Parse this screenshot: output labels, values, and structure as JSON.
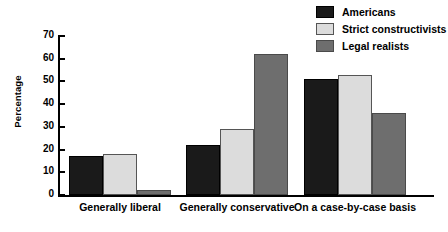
{
  "chart_data": {
    "type": "bar",
    "title": "",
    "xlabel": "",
    "ylabel": "Percentage",
    "ylim": [
      0,
      70
    ],
    "yticks": [
      0,
      10,
      20,
      30,
      40,
      50,
      60,
      70
    ],
    "ytick_labels": [
      "0",
      "10",
      "20",
      "30",
      "40",
      "50",
      "60",
      "70"
    ],
    "grid": false,
    "legend_position": "top-right",
    "categories": [
      "Generally liberal",
      "Generally conservative",
      "On a case-by-case basis"
    ],
    "series": [
      {
        "name": "Americans",
        "color": "#1a1a1a",
        "values": [
          17,
          22,
          51
        ]
      },
      {
        "name": "Strict constructivists",
        "color": "#dcdcdc",
        "values": [
          18,
          29,
          53
        ]
      },
      {
        "name": "Legal realists",
        "color": "#6e6e6e",
        "values": [
          2,
          62,
          36
        ]
      }
    ]
  }
}
